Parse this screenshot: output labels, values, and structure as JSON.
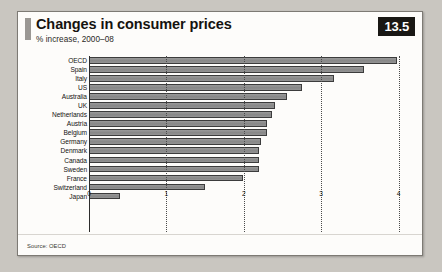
{
  "figure": {
    "badge": "13.5",
    "title": "Changes in consumer prices",
    "subtitle": "% increase, 2000–08",
    "source": "Source: OECD"
  },
  "chart_data": {
    "type": "bar",
    "orientation": "horizontal",
    "title": "Changes in consumer prices",
    "subtitle": "% increase, 2000–08",
    "xlabel": "",
    "ylabel": "",
    "xlim": [
      0,
      4.2
    ],
    "grid": true,
    "gridlines": [
      0,
      1,
      2,
      3,
      4
    ],
    "tick_labels": [
      "0",
      "1",
      "2",
      "3",
      "4"
    ],
    "legend": null,
    "source": "Source: OECD",
    "categories": [
      "OECD",
      "Spain",
      "Italy",
      "US",
      "Australia",
      "UK",
      "Netherlands",
      "Austria",
      "Belgium",
      "Germany",
      "Denmark",
      "Canada",
      "Sweden",
      "France",
      "Switzerland",
      "Japan"
    ],
    "values": [
      3.98,
      3.56,
      3.16,
      2.75,
      2.56,
      2.4,
      2.36,
      2.3,
      2.3,
      2.22,
      2.2,
      2.2,
      2.2,
      1.99,
      1.5,
      0.4
    ]
  }
}
